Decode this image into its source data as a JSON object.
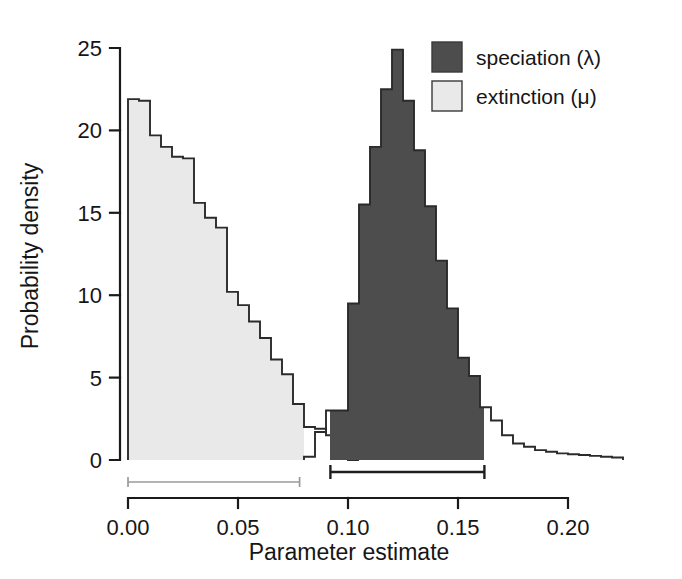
{
  "chart_data": {
    "type": "bar",
    "title": "",
    "subtitle": "",
    "xlabel": "Parameter estimate",
    "ylabel": "Probability density",
    "xlim": [
      -0.006,
      0.232
    ],
    "ylim": [
      0,
      25
    ],
    "xticks": [
      0.0,
      0.05,
      0.1,
      0.15,
      0.2
    ],
    "xtick_labels": [
      "0.00",
      "0.05",
      "0.10",
      "0.15",
      "0.20"
    ],
    "yticks": [
      0,
      5,
      10,
      15,
      20,
      25
    ],
    "ytick_labels": [
      "0",
      "5",
      "10",
      "15",
      "20",
      "25"
    ],
    "grid": false,
    "legend_position": "top-right",
    "bin_width": 0.005,
    "series": [
      {
        "name": "extinction",
        "label": "extinction (μ)",
        "symbol": "μ",
        "fill_color": "#e9e9e9",
        "edge_color": "#2b2b2b",
        "bin_starts": [
          0.0,
          0.005,
          0.01,
          0.015,
          0.02,
          0.025,
          0.03,
          0.035,
          0.04,
          0.045,
          0.05,
          0.055,
          0.06,
          0.065,
          0.07,
          0.075,
          0.08,
          0.085,
          0.09,
          0.095,
          0.1
        ],
        "values": [
          21.9,
          21.8,
          19.7,
          19.0,
          18.4,
          18.3,
          15.6,
          14.7,
          14.1,
          10.2,
          9.4,
          8.4,
          7.4,
          6.1,
          5.2,
          3.4,
          2.0,
          1.9,
          1.5,
          0.5,
          0.0
        ],
        "filled_until": 0.08,
        "credible_interval": [
          0.0,
          0.078
        ]
      },
      {
        "name": "speciation",
        "label": "speciation (λ)",
        "symbol": "λ",
        "fill_color": "#4d4d4d",
        "edge_color": "#2b2b2b",
        "bin_starts": [
          0.08,
          0.085,
          0.09,
          0.095,
          0.1,
          0.105,
          0.11,
          0.115,
          0.12,
          0.125,
          0.13,
          0.135,
          0.14,
          0.145,
          0.15,
          0.155,
          0.16,
          0.165,
          0.17,
          0.175,
          0.18,
          0.185,
          0.19,
          0.195,
          0.2,
          0.205,
          0.21,
          0.215,
          0.22
        ],
        "values": [
          0.2,
          1.7,
          3.0,
          3.0,
          9.5,
          15.5,
          19.0,
          22.5,
          24.9,
          21.8,
          18.8,
          15.4,
          12.1,
          9.2,
          6.2,
          5.1,
          3.2,
          2.4,
          1.5,
          1.0,
          0.8,
          0.6,
          0.5,
          0.4,
          0.35,
          0.3,
          0.25,
          0.2,
          0.15
        ],
        "filled_from": 0.092,
        "filled_to": 0.162,
        "credible_interval": [
          0.092,
          0.162
        ]
      }
    ],
    "annotations": [
      {
        "name": "extinction-credible-interval",
        "kind": "interval-bar",
        "range": [
          0.0,
          0.078
        ],
        "color": "#9a9a9a"
      },
      {
        "name": "speciation-credible-interval",
        "kind": "interval-bar",
        "range": [
          0.092,
          0.162
        ],
        "color": "#1f1f1f"
      }
    ]
  },
  "legend": {
    "entries": [
      {
        "label": "speciation (λ)",
        "color": "#4d4d4d"
      },
      {
        "label": "extinction (μ)",
        "color": "#e9e9e9"
      }
    ]
  },
  "axes": {
    "x_title": "Parameter estimate",
    "y_title": "Probability density"
  }
}
